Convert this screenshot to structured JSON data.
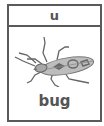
{
  "card": {
    "letter": "u",
    "word": "bug",
    "image_icon": "bug-icon"
  },
  "colors": {
    "border": "#5a5a5a",
    "text": "#555555",
    "bug_body": "#b8b8b8",
    "bug_markings": "#6a6a6a"
  }
}
